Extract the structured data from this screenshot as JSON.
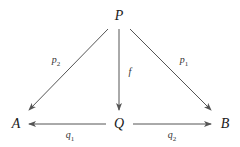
{
  "diagram": {
    "type": "commutative-diagram",
    "nodes": [
      {
        "id": "P",
        "label": "P",
        "x": 119,
        "y": 16
      },
      {
        "id": "A",
        "label": "A",
        "x": 16,
        "y": 124
      },
      {
        "id": "Q",
        "label": "Q",
        "x": 119,
        "y": 124
      },
      {
        "id": "B",
        "label": "B",
        "x": 225,
        "y": 124
      }
    ],
    "edges": [
      {
        "from": "P",
        "to": "A",
        "label": "p",
        "sub": "2"
      },
      {
        "from": "P",
        "to": "Q",
        "label": "f",
        "sub": ""
      },
      {
        "from": "P",
        "to": "B",
        "label": "p",
        "sub": "1"
      },
      {
        "from": "Q",
        "to": "A",
        "label": "q",
        "sub": "1"
      },
      {
        "from": "Q",
        "to": "B",
        "label": "q",
        "sub": "2"
      }
    ]
  },
  "colors": {
    "line": "#555555",
    "text": "#1a1a1a"
  }
}
